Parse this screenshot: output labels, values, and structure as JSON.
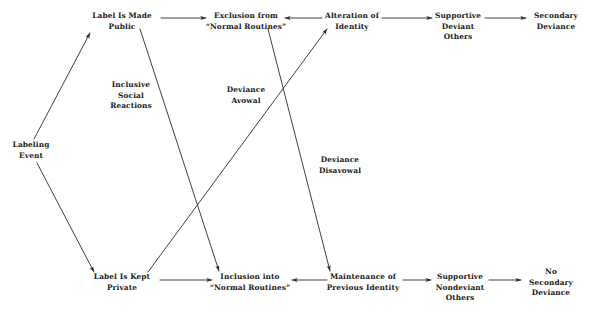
{
  "diagram": {
    "background_color": "#ffffff",
    "line_color": "#2a2a2a",
    "text_color": "#1a1a1a",
    "nodes": [
      {
        "id": "labeling_event",
        "label": "Labeling\nEvent",
        "x": 31,
        "y": 151
      },
      {
        "id": "label_made_public",
        "label": "Label Is Made\nPublic",
        "x": 122,
        "y": 22
      },
      {
        "id": "exclusion",
        "label": "Exclusion from\n“Normal Routines”",
        "x": 246,
        "y": 22
      },
      {
        "id": "alteration_identity",
        "label": "Alteration of\nIdentity",
        "x": 352,
        "y": 22
      },
      {
        "id": "supportive_deviant",
        "label": "Supportive\nDeviant\nOthers",
        "x": 458,
        "y": 27
      },
      {
        "id": "secondary_deviance",
        "label": "Secondary\nDeviance",
        "x": 556,
        "y": 22
      },
      {
        "id": "label_kept_private",
        "label": "Label Is Kept\nPrivate",
        "x": 122,
        "y": 283
      },
      {
        "id": "inclusion",
        "label": "Inclusion into\n“Normal Routines”",
        "x": 250,
        "y": 283
      },
      {
        "id": "maintenance_identity",
        "label": "Maintenance of\nPrevious Identity",
        "x": 363,
        "y": 283
      },
      {
        "id": "supportive_nondeviant",
        "label": "Supportive\nNondeviant\nOthers",
        "x": 460,
        "y": 288
      },
      {
        "id": "no_secondary_deviance",
        "label": "No Secondary\nDeviance",
        "x": 551,
        "y": 283
      }
    ],
    "edge_labels": [
      {
        "id": "inclusive_social_reactions",
        "label": "Inclusive\nSocial\nReactions",
        "x": 131,
        "y": 96
      },
      {
        "id": "deviance_avowal",
        "label": "Deviance\nAvowal",
        "x": 246,
        "y": 96
      },
      {
        "id": "deviance_disavowal",
        "label": "Deviance\nDisavowal",
        "x": 340,
        "y": 166
      }
    ],
    "edges": [
      {
        "id": "edge-labeling-to-public",
        "from": "labeling_event",
        "to": "label_made_public",
        "x1": 34,
        "y1": 139,
        "x2": 90,
        "y2": 33,
        "arrow": "end"
      },
      {
        "id": "edge-labeling-to-private",
        "from": "labeling_event",
        "to": "label_kept_private",
        "x1": 37,
        "y1": 163,
        "x2": 94,
        "y2": 272,
        "arrow": "end"
      },
      {
        "id": "edge-public-to-exclusion",
        "from": "label_made_public",
        "to": "exclusion",
        "x1": 161,
        "y1": 18,
        "x2": 206,
        "y2": 18,
        "arrow": "end"
      },
      {
        "id": "edge-exclusion-to-alteration",
        "from": "exclusion",
        "to": "alteration_identity",
        "x1": 322,
        "y1": 18,
        "x2": 285,
        "y2": 18,
        "arrow": "end"
      },
      {
        "id": "edge-alteration-to-supportive",
        "from": "alteration_identity",
        "to": "supportive_deviant",
        "x1": 382,
        "y1": 18,
        "x2": 432,
        "y2": 18,
        "arrow": "end"
      },
      {
        "id": "edge-supportive-to-secondary",
        "from": "supportive_deviant",
        "to": "secondary_deviance",
        "x1": 485,
        "y1": 18,
        "x2": 526,
        "y2": 18,
        "arrow": "end"
      },
      {
        "id": "edge-private-to-inclusion",
        "from": "label_kept_private",
        "to": "inclusion",
        "x1": 160,
        "y1": 280,
        "x2": 212,
        "y2": 280,
        "arrow": "end"
      },
      {
        "id": "edge-inclusion-to-maintenance",
        "from": "inclusion",
        "to": "maintenance_identity",
        "x1": 327,
        "y1": 280,
        "x2": 292,
        "y2": 280,
        "arrow": "end"
      },
      {
        "id": "edge-maintenance-to-supportive",
        "from": "maintenance_identity",
        "to": "supportive_nondeviant",
        "x1": 403,
        "y1": 280,
        "x2": 431,
        "y2": 280,
        "arrow": "end"
      },
      {
        "id": "edge-supportive-to-nosecondary",
        "from": "supportive_nondeviant",
        "to": "no_secondary_deviance",
        "x1": 489,
        "y1": 280,
        "x2": 521,
        "y2": 280,
        "arrow": "end"
      },
      {
        "id": "edge-public-to-inclusion",
        "from": "label_made_public",
        "to": "inclusion",
        "x1": 140,
        "y1": 29,
        "x2": 219,
        "y2": 271,
        "arrow": "end"
      },
      {
        "id": "edge-private-to-alteration",
        "from": "label_kept_private",
        "to": "alteration_identity",
        "x1": 148,
        "y1": 272,
        "x2": 327,
        "y2": 29,
        "arrow": "end"
      },
      {
        "id": "edge-exclusion-to-maintenance",
        "from": "exclusion",
        "to": "maintenance_identity",
        "x1": 268,
        "y1": 29,
        "x2": 330,
        "y2": 271,
        "arrow": "end"
      }
    ]
  }
}
